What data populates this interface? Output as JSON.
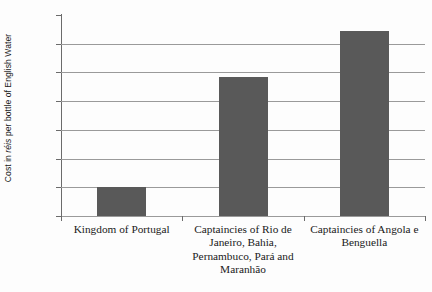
{
  "chart_data": {
    "type": "bar",
    "title": "",
    "xlabel": "",
    "ylabel": "Cost in réis per bottle of English Water",
    "ylabel_parts": {
      "before": "Cost in ",
      "italic": "réis",
      "after": " per bottle of English Water"
    },
    "categories": [
      "Kingdom of Portugal",
      "Captaincies of Rio de Janeiro, Bahia, Pernambuco, Pará and Maranhão",
      "Captaincies of Angola e Benguella"
    ],
    "category_lines": [
      [
        "Kingdom of Portugal"
      ],
      [
        "Captaincies of Rio de",
        "Janeiro, Bahia,",
        "Pernambuco, Pará and",
        "Maranhão"
      ],
      [
        "Captaincies of Angola e",
        "Benguella"
      ]
    ],
    "values": [
      1000,
      4850,
      6450
    ],
    "ylim": [
      0,
      7000
    ],
    "ytick_values": [
      7000,
      6000,
      5000,
      4000,
      3000,
      2000,
      1000,
      0
    ],
    "ytick_labels": [
      "7,000",
      "6,000",
      "5,000",
      "4,000",
      "3,000",
      "2,000",
      "1,000",
      "0"
    ],
    "grid": true,
    "legend": false,
    "bar_color": "#595959",
    "grid_color": "#9a9a9a",
    "axis_color": "#6b6b6b",
    "background": "#fdfdfd"
  }
}
